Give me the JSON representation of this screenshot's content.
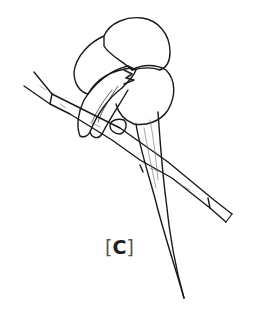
{
  "figure": {
    "label": {
      "open": "[",
      "letter": "C",
      "close": "]"
    },
    "colors": {
      "ink": "#1a1a1a",
      "background": "#ffffff"
    }
  }
}
